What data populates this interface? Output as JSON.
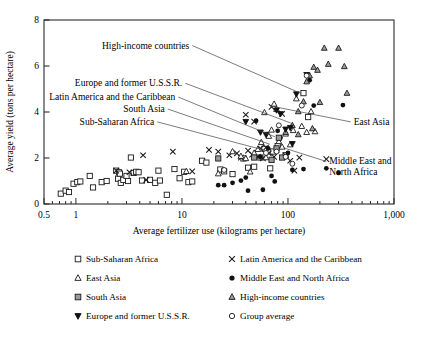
{
  "chart_data": {
    "type": "scatter",
    "title": "",
    "xlabel": "Average fertilizer use (kilograms per hectare)",
    "ylabel": "Average yield (tons per hectare)",
    "xscale": "log",
    "xlim": [
      0.5,
      1000
    ],
    "ylim": [
      0,
      8
    ],
    "xticks_labeled": [
      "0.5",
      "1",
      "10",
      "100",
      "1,000"
    ],
    "xticks_values": [
      0.5,
      1,
      10,
      100,
      1000
    ],
    "yticks_labeled": [
      "0",
      "2",
      "4",
      "6",
      "8"
    ],
    "yticks_values": [
      0,
      2,
      4,
      6,
      8
    ],
    "grid": false,
    "legend_position": "below-plot",
    "annotations": [
      {
        "text": "High-income countries",
        "x": 0.415,
        "y": 0.845,
        "anchor": "end",
        "leader_to": [
          0.735,
          0.6
        ]
      },
      {
        "text": "Europe and former U.S.S.R.",
        "x": 0.395,
        "y": 0.64,
        "anchor": "end",
        "leader_to": [
          0.705,
          0.44
        ]
      },
      {
        "text": "Latin America and the Caribbean",
        "x": 0.375,
        "y": 0.565,
        "anchor": "end",
        "leader_to": [
          0.66,
          0.365
        ]
      },
      {
        "text": "South Asia",
        "x": 0.345,
        "y": 0.5,
        "anchor": "end",
        "leader_to": [
          0.645,
          0.325
        ]
      },
      {
        "text": "Sub-Saharan Africa",
        "x": 0.315,
        "y": 0.43,
        "anchor": "end",
        "leader_to": [
          0.625,
          0.295
        ]
      },
      {
        "text": "East Asia",
        "x": 0.885,
        "y": 0.43,
        "anchor": "start",
        "leader_to": [
          0.655,
          0.53
        ]
      },
      {
        "text": "Middle East and",
        "x": 0.815,
        "y": 0.215,
        "anchor": "start",
        "leader_to": [
          0.685,
          0.305
        ]
      },
      {
        "text": "North Africa",
        "x": 0.815,
        "y": 0.155,
        "anchor": "start",
        "leader_to": null
      }
    ],
    "series": [
      {
        "name": "Sub-Saharan Africa",
        "marker": "open-square",
        "points": [
          [
            0.72,
            0.45
          ],
          [
            0.8,
            0.58
          ],
          [
            0.86,
            0.52
          ],
          [
            0.95,
            0.88
          ],
          [
            1.03,
            0.95
          ],
          [
            1.1,
            0.98
          ],
          [
            1.35,
            1.22
          ],
          [
            1.45,
            0.72
          ],
          [
            1.75,
            0.95
          ],
          [
            1.95,
            1.0
          ],
          [
            2.4,
            1.45
          ],
          [
            2.5,
            1.1
          ],
          [
            2.55,
            1.38
          ],
          [
            2.6,
            1.32
          ],
          [
            2.65,
            0.92
          ],
          [
            2.8,
            1.05
          ],
          [
            3.0,
            1.22
          ],
          [
            3.1,
            1.0
          ],
          [
            3.3,
            2.02
          ],
          [
            3.5,
            1.35
          ],
          [
            3.7,
            1.4
          ],
          [
            3.9,
            1.38
          ],
          [
            4.2,
            1.02
          ],
          [
            5.0,
            1.05
          ],
          [
            5.6,
            0.92
          ],
          [
            6.0,
            1.45
          ],
          [
            6.2,
            1.02
          ],
          [
            7.2,
            0.4
          ],
          [
            8.5,
            1.52
          ],
          [
            9.5,
            1.12
          ],
          [
            10.5,
            1.4
          ],
          [
            11.5,
            0.95
          ],
          [
            12.5,
            0.98
          ],
          [
            15.5,
            1.88
          ],
          [
            17.0,
            1.8
          ],
          [
            23.0,
            1.5
          ],
          [
            25.0,
            1.42
          ],
          [
            30.0,
            1.3
          ],
          [
            38.0,
            1.98
          ],
          [
            42.0,
            1.58
          ],
          [
            48.0,
            1.62
          ],
          [
            55.0,
            2.02
          ],
          [
            60.0,
            2.4
          ],
          [
            68.0,
            1.55
          ],
          [
            72.0,
            2.28
          ],
          [
            80.0,
            2.52
          ],
          [
            95.0,
            2.12
          ],
          [
            140.0,
            4.82
          ],
          [
            155.0,
            3.78
          ]
        ]
      },
      {
        "name": "Latin America and the Caribbean",
        "marker": "cross",
        "points": [
          [
            2.4,
            1.45
          ],
          [
            3.2,
            1.38
          ],
          [
            4.3,
            2.12
          ],
          [
            4.6,
            1.05
          ],
          [
            8.2,
            2.28
          ],
          [
            12.5,
            1.42
          ],
          [
            18.0,
            2.35
          ],
          [
            22.0,
            2.28
          ],
          [
            28.0,
            2.12
          ],
          [
            33.0,
            2.2
          ],
          [
            36.0,
            2.02
          ],
          [
            40.0,
            3.88
          ],
          [
            42.0,
            2.32
          ],
          [
            46.0,
            2.15
          ],
          [
            48.0,
            3.58
          ],
          [
            52.0,
            2.05
          ],
          [
            55.0,
            2.42
          ],
          [
            58.0,
            1.98
          ],
          [
            62.0,
            2.45
          ],
          [
            66.0,
            2.2
          ],
          [
            70.0,
            4.22
          ],
          [
            74.0,
            2.05
          ],
          [
            78.0,
            2.35
          ],
          [
            88.0,
            3.92
          ],
          [
            95.0,
            2.12
          ],
          [
            105.0,
            1.88
          ],
          [
            115.0,
            1.45
          ],
          [
            128.0,
            2.02
          ],
          [
            230.0,
            1.95
          ]
        ]
      },
      {
        "name": "East Asia",
        "marker": "open-triangle",
        "points": [
          [
            11.0,
            1.42
          ],
          [
            22.0,
            1.32
          ],
          [
            30.0,
            2.28
          ],
          [
            36.0,
            2.08
          ],
          [
            40.0,
            1.98
          ],
          [
            44.0,
            1.4
          ],
          [
            48.0,
            2.22
          ],
          [
            52.0,
            2.38
          ],
          [
            56.0,
            2.68
          ],
          [
            60.0,
            3.98
          ],
          [
            62.0,
            2.02
          ],
          [
            66.0,
            2.95
          ],
          [
            70.0,
            3.22
          ],
          [
            74.0,
            4.35
          ],
          [
            78.0,
            4.12
          ],
          [
            82.0,
            2.72
          ],
          [
            88.0,
            2.48
          ],
          [
            95.0,
            3.05
          ],
          [
            105.0,
            2.58
          ],
          [
            112.0,
            3.2
          ],
          [
            120.0,
            4.58
          ],
          [
            135.0,
            3.38
          ],
          [
            150.0,
            3.12
          ],
          [
            165.0,
            4.02
          ],
          [
            180.0,
            3.15
          ]
        ]
      },
      {
        "name": "Middle East and North Africa",
        "marker": "filled-circle",
        "points": [
          [
            22.0,
            0.82
          ],
          [
            25.0,
            0.82
          ],
          [
            30.0,
            0.92
          ],
          [
            36.0,
            1.02
          ],
          [
            40.0,
            1.15
          ],
          [
            42.0,
            0.58
          ],
          [
            50.0,
            3.62
          ],
          [
            55.0,
            2.05
          ],
          [
            58.0,
            0.62
          ],
          [
            65.0,
            2.42
          ],
          [
            70.0,
            1.22
          ],
          [
            75.0,
            0.98
          ],
          [
            80.0,
            3.18
          ],
          [
            85.0,
            2.88
          ],
          [
            92.0,
            2.02
          ],
          [
            100.0,
            2.22
          ],
          [
            110.0,
            1.48
          ],
          [
            140.0,
            1.52
          ],
          [
            160.0,
            5.38
          ],
          [
            175.0,
            4.28
          ],
          [
            230.0,
            1.55
          ],
          [
            300.0,
            1.35
          ],
          [
            330.0,
            4.3
          ]
        ]
      },
      {
        "name": "South Asia",
        "marker": "shaded-square",
        "points": [
          [
            22.0,
            1.98
          ],
          [
            48.0,
            2.02
          ],
          [
            70.0,
            1.92
          ],
          [
            78.0,
            2.42
          ],
          [
            82.0,
            2.88
          ],
          [
            88.0,
            2.02
          ]
        ]
      },
      {
        "name": "High-income countries",
        "marker": "shaded-triangle",
        "points": [
          [
            95.0,
            3.12
          ],
          [
            110.0,
            3.42
          ],
          [
            125.0,
            4.02
          ],
          [
            140.0,
            4.45
          ],
          [
            150.0,
            5.32
          ],
          [
            160.0,
            5.58
          ],
          [
            175.0,
            5.95
          ],
          [
            190.0,
            5.82
          ],
          [
            220.0,
            6.78
          ],
          [
            240.0,
            6.08
          ],
          [
            300.0,
            6.78
          ],
          [
            340.0,
            5.98
          ],
          [
            360.0,
            4.82
          ],
          [
            170.0,
            3.28
          ],
          [
            200.0,
            4.42
          ],
          [
            125.0,
            3.02
          ]
        ]
      },
      {
        "name": "Europe and former U.S.S.R.",
        "marker": "filled-down-triangle",
        "points": [
          [
            40.0,
            3.58
          ],
          [
            55.0,
            3.12
          ],
          [
            62.0,
            3.02
          ],
          [
            78.0,
            4.08
          ],
          [
            85.0,
            3.92
          ],
          [
            95.0,
            3.25
          ],
          [
            105.0,
            3.32
          ],
          [
            120.0,
            4.78
          ],
          [
            150.0,
            5.62
          ],
          [
            110.0,
            2.62
          ]
        ]
      },
      {
        "name": "Group average",
        "marker": "open-circle",
        "points": [
          [
            25.0,
            1.48
          ],
          [
            78.0,
            2.28
          ],
          [
            82.0,
            3.42
          ],
          [
            95.0,
            2.05
          ],
          [
            110.0,
            1.75
          ],
          [
            135.0,
            4.28
          ],
          [
            150.0,
            5.58
          ],
          [
            62.0,
            2.22
          ]
        ]
      }
    ]
  },
  "legend": {
    "rows": [
      [
        {
          "marker": "open-square",
          "label": "Sub-Saharan Africa"
        },
        {
          "marker": "cross",
          "label": "Latin America and the Caribbean"
        }
      ],
      [
        {
          "marker": "open-triangle",
          "label": "East Asia"
        },
        {
          "marker": "filled-circle",
          "label": "Middle East and North Africa"
        }
      ],
      [
        {
          "marker": "shaded-square",
          "label": "South Asia"
        },
        {
          "marker": "shaded-triangle",
          "label": "High-income countries"
        }
      ],
      [
        {
          "marker": "filled-down-triangle",
          "label": "Europe and former U.S.S.R."
        },
        {
          "marker": "open-circle",
          "label": "Group average"
        }
      ]
    ]
  },
  "colors": {
    "axis": "#2a2a2a",
    "marker_stroke": "#1a1a1a",
    "shade_fill": "#9a9a9a",
    "background": "#ffffff"
  }
}
